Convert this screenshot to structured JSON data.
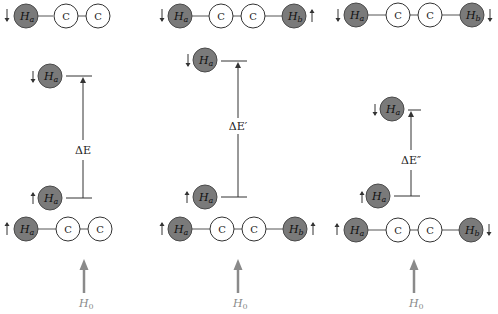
{
  "figure": {
    "colors": {
      "hydrogen_fill": "#7a7a7a",
      "carbon_fill": "#ffffff",
      "field_arrow": "#8a8a8a"
    },
    "panels": [
      {
        "id": "panel-1",
        "top_molecule": {
          "atoms": [
            {
              "label": "Ha",
              "sub": "a",
              "type": "H",
              "spin": "down"
            },
            {
              "label": "C",
              "type": "C"
            },
            {
              "label": "C",
              "type": "C"
            }
          ]
        },
        "upper_level": {
          "atom": "H",
          "sub": "a",
          "spin": "down"
        },
        "lower_level": {
          "atom": "H",
          "sub": "a",
          "spin": "up"
        },
        "energy_gap_label": "ΔE",
        "bottom_molecule": {
          "atoms": [
            {
              "label": "Ha",
              "sub": "a",
              "type": "H",
              "spin": "up"
            },
            {
              "label": "C",
              "type": "C"
            },
            {
              "label": "C",
              "type": "C"
            }
          ]
        },
        "field_label": "H",
        "field_sub": "0"
      },
      {
        "id": "panel-2",
        "top_molecule": {
          "atoms": [
            {
              "label": "Ha",
              "sub": "a",
              "type": "H",
              "spin": "down"
            },
            {
              "label": "C",
              "type": "C"
            },
            {
              "label": "C",
              "type": "C"
            },
            {
              "label": "Hb",
              "sub": "b",
              "type": "H",
              "spin": "up"
            }
          ]
        },
        "upper_level": {
          "atom": "H",
          "sub": "a",
          "spin": "down"
        },
        "lower_level": {
          "atom": "H",
          "sub": "a",
          "spin": "up"
        },
        "energy_gap_label": "ΔE′",
        "bottom_molecule": {
          "atoms": [
            {
              "label": "Ha",
              "sub": "a",
              "type": "H",
              "spin": "up"
            },
            {
              "label": "C",
              "type": "C"
            },
            {
              "label": "C",
              "type": "C"
            },
            {
              "label": "Hb",
              "sub": "b",
              "type": "H",
              "spin": "up"
            }
          ]
        },
        "field_label": "H",
        "field_sub": "0"
      },
      {
        "id": "panel-3",
        "top_molecule": {
          "atoms": [
            {
              "label": "Ha",
              "sub": "a",
              "type": "H",
              "spin": "down"
            },
            {
              "label": "C",
              "type": "C"
            },
            {
              "label": "C",
              "type": "C"
            },
            {
              "label": "Hb",
              "sub": "b",
              "type": "H",
              "spin": "down"
            }
          ]
        },
        "upper_level": {
          "atom": "H",
          "sub": "a",
          "spin": "down"
        },
        "lower_level": {
          "atom": "H",
          "sub": "a",
          "spin": "up"
        },
        "energy_gap_label": "ΔE″",
        "bottom_molecule": {
          "atoms": [
            {
              "label": "Ha",
              "sub": "a",
              "type": "H",
              "spin": "up"
            },
            {
              "label": "C",
              "type": "C"
            },
            {
              "label": "C",
              "type": "C"
            },
            {
              "label": "Hb",
              "sub": "b",
              "type": "H",
              "spin": "down"
            }
          ]
        },
        "field_label": "H",
        "field_sub": "0"
      }
    ]
  },
  "labels": {
    "H": "H",
    "C": "C",
    "a": "a",
    "b": "b",
    "dE1": "ΔE",
    "dE2": "ΔE′",
    "dE3": "ΔE″",
    "H0": "H",
    "zero": "0"
  }
}
